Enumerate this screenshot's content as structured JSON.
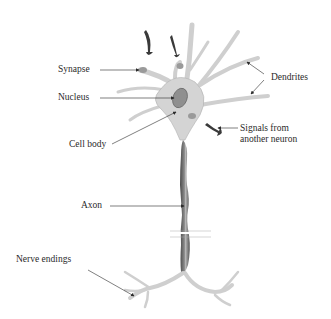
{
  "diagram": {
    "labels": {
      "synapse": "Synapse",
      "nucleus": "Nucleus",
      "cell_body": "Cell body",
      "dendrites": "Dendrites",
      "signals_line1": "Signals from",
      "signals_line2": "another neuron",
      "axon": "Axon",
      "nerve_endings": "Nerve endings"
    },
    "colors": {
      "cell": "#d4d4d4",
      "cell_edge": "#9a9a9a",
      "axon": "#6e6e6e",
      "axon_dark": "#4a4a4a",
      "arrow": "#3a3a3a",
      "text": "#2a2a2a"
    }
  }
}
